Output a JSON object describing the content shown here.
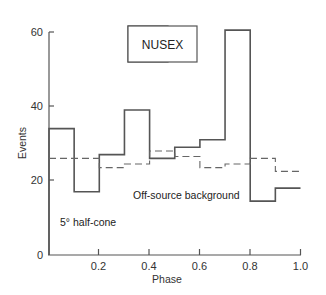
{
  "chart_data": {
    "type": "line",
    "subtype": "step-histogram",
    "title": "NUSEX",
    "xlabel": "Phase",
    "ylabel": "Events",
    "xlim": [
      0,
      1.0
    ],
    "ylim": [
      0,
      60
    ],
    "x_ticks": [
      0.2,
      0.4,
      0.6,
      0.8,
      1.0
    ],
    "x_tick_labels": [
      "0.2",
      "0.4",
      "0.6",
      "0.8",
      "1.0"
    ],
    "y_ticks": [
      0,
      20,
      40,
      60
    ],
    "y_tick_labels": [
      "0",
      "20",
      "40",
      "60"
    ],
    "grid": false,
    "bin_edges": [
      0,
      0.1,
      0.2,
      0.3,
      0.4,
      0.5,
      0.6,
      0.7,
      0.8,
      0.9,
      1.0
    ],
    "series": [
      {
        "name": "NUSEX events",
        "style": "solid",
        "values": [
          34,
          17,
          27,
          39,
          26,
          29,
          31,
          60.5,
          14.5,
          18
        ]
      },
      {
        "name": "Off-source background",
        "style": "dashed",
        "values": [
          26,
          26,
          23.5,
          24.5,
          28,
          26.5,
          23.5,
          24.5,
          26,
          22.5
        ]
      }
    ],
    "annotations": [
      "Off-source background",
      "5° half-cone"
    ]
  },
  "labels": {
    "title": "NUSEX",
    "xlabel": "Phase",
    "ylabel": "Events",
    "background_label": "Off-source background",
    "cone_label": "5° half-cone",
    "y0": "0",
    "y20": "20",
    "y40": "40",
    "y60": "60",
    "x02": "0.2",
    "x04": "0.4",
    "x06": "0.6",
    "x08": "0.8",
    "x10": "1.0"
  }
}
